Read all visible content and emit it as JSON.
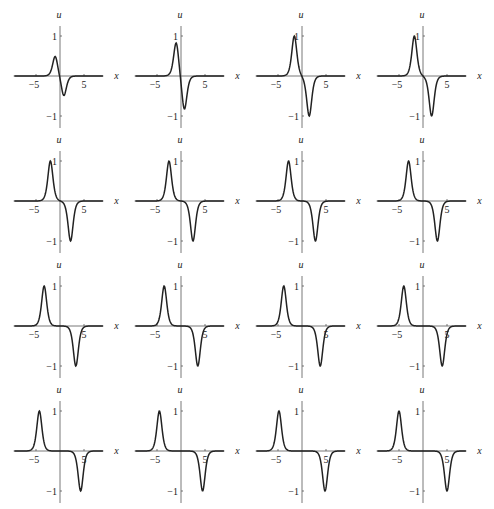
{
  "chart_data": {
    "type": "line",
    "layout": {
      "rows": 4,
      "cols": 4,
      "order": "row-major"
    },
    "xlabel": "x",
    "ylabel": "u",
    "xlim": [
      -8,
      8
    ],
    "ylim": [
      -1.2,
      1.2
    ],
    "xticks": [
      -5,
      5
    ],
    "xtick_labels": [
      "−5",
      "5"
    ],
    "yticks": [
      1,
      -1
    ],
    "ytick_labels": [
      "1",
      "−1"
    ],
    "grid": false,
    "legend": null,
    "line_color": "#222222",
    "panels": [
      {
        "id": 1,
        "pos_peak": {
          "x": -1.0,
          "u": 0.5
        },
        "neg_peak": {
          "x": 0.8,
          "u": -0.5
        }
      },
      {
        "id": 2,
        "pos_peak": {
          "x": -1.0,
          "u": 0.85
        },
        "neg_peak": {
          "x": 0.7,
          "u": -0.85
        }
      },
      {
        "id": 3,
        "pos_peak": {
          "x": -1.6,
          "u": 1.0
        },
        "neg_peak": {
          "x": 1.5,
          "u": -1.0
        }
      },
      {
        "id": 4,
        "pos_peak": {
          "x": -1.8,
          "u": 1.0
        },
        "neg_peak": {
          "x": 1.8,
          "u": -1.0
        }
      },
      {
        "id": 5,
        "pos_peak": {
          "x": -2.0,
          "u": 1.0
        },
        "neg_peak": {
          "x": 2.2,
          "u": -1.0
        }
      },
      {
        "id": 6,
        "pos_peak": {
          "x": -2.5,
          "u": 1.0
        },
        "neg_peak": {
          "x": 2.5,
          "u": -1.0
        }
      },
      {
        "id": 7,
        "pos_peak": {
          "x": -2.8,
          "u": 1.0
        },
        "neg_peak": {
          "x": 2.8,
          "u": -1.0
        }
      },
      {
        "id": 8,
        "pos_peak": {
          "x": -3.0,
          "u": 1.0
        },
        "neg_peak": {
          "x": 3.0,
          "u": -1.0
        }
      },
      {
        "id": 9,
        "pos_peak": {
          "x": -3.3,
          "u": 1.0
        },
        "neg_peak": {
          "x": 3.3,
          "u": -1.0
        }
      },
      {
        "id": 10,
        "pos_peak": {
          "x": -3.5,
          "u": 1.0
        },
        "neg_peak": {
          "x": 3.5,
          "u": -1.0
        }
      },
      {
        "id": 11,
        "pos_peak": {
          "x": -3.8,
          "u": 1.0
        },
        "neg_peak": {
          "x": 3.8,
          "u": -1.0
        }
      },
      {
        "id": 12,
        "pos_peak": {
          "x": -4.0,
          "u": 1.0
        },
        "neg_peak": {
          "x": 4.0,
          "u": -1.0
        }
      },
      {
        "id": 13,
        "pos_peak": {
          "x": -4.3,
          "u": 1.0
        },
        "neg_peak": {
          "x": 4.3,
          "u": -1.0
        }
      },
      {
        "id": 14,
        "pos_peak": {
          "x": -4.5,
          "u": 1.0
        },
        "neg_peak": {
          "x": 4.5,
          "u": -1.0
        }
      },
      {
        "id": 15,
        "pos_peak": {
          "x": -4.8,
          "u": 1.0
        },
        "neg_peak": {
          "x": 4.8,
          "u": -1.0
        }
      },
      {
        "id": 16,
        "pos_peak": {
          "x": -5.0,
          "u": 1.0
        },
        "neg_peak": {
          "x": 5.0,
          "u": -1.0
        }
      }
    ]
  }
}
